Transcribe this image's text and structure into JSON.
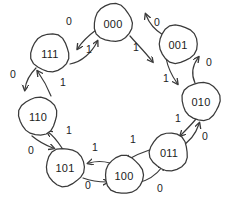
{
  "figure": {
    "title": "",
    "kind": "state-transition-diagram",
    "background_color": "#ffffff",
    "stroke_color": "#3a3a3a",
    "text_color": "#1c1c1c"
  },
  "chart_data": {
    "type": "diagram",
    "title": "",
    "xlabel": "",
    "ylabel": "",
    "nodes": [
      {
        "id": "000",
        "label": "000",
        "cx": 113,
        "cy": 23,
        "r": 19
      },
      {
        "id": "001",
        "label": "001",
        "cx": 178,
        "cy": 44,
        "r": 19
      },
      {
        "id": "010",
        "label": "010",
        "cx": 201,
        "cy": 101,
        "r": 19
      },
      {
        "id": "011",
        "label": "011",
        "cx": 169,
        "cy": 152,
        "r": 19
      },
      {
        "id": "100",
        "label": "100",
        "cx": 124,
        "cy": 175,
        "r": 19
      },
      {
        "id": "101",
        "label": "101",
        "cx": 65,
        "cy": 167,
        "r": 19
      },
      {
        "id": "110",
        "label": "110",
        "cx": 38,
        "cy": 116,
        "r": 19
      },
      {
        "id": "111",
        "label": "111",
        "cx": 50,
        "cy": 53,
        "r": 19
      }
    ],
    "edges": [
      {
        "from": "000",
        "to": "111",
        "label": "0",
        "lx": 69,
        "ly": 21,
        "d": "M 96 30 C 88 36 82 42 78 48",
        "arrow": [
          78,
          48,
          133
        ]
      },
      {
        "from": "111",
        "to": "000",
        "label": "1",
        "lx": 89,
        "ly": 49,
        "d": "M 70 64 C 82 62 92 52 97 42",
        "arrow": [
          97,
          42,
          -62
        ]
      },
      {
        "from": "001",
        "to": "000",
        "label": "0",
        "lx": 157,
        "ly": 22,
        "d": "M 163 35 C 155 30 149 23 146 15",
        "arrow": [
          146,
          15,
          -112
        ]
      },
      {
        "from": "000",
        "to": "010",
        "label": "1",
        "lx": 136,
        "ly": 47,
        "d": "M 130 36 C 137 44 145 52 152 61",
        "arrow": [
          152,
          61,
          52
        ]
      },
      {
        "from": "010",
        "to": "001",
        "label": "0",
        "lx": 209,
        "ly": 62,
        "d": "M 195 83 C 191 74 192 66 198 58",
        "arrow": [
          198,
          58,
          -50
        ]
      },
      {
        "from": "001",
        "to": "010",
        "label": "1",
        "lx": 166,
        "ly": 78,
        "d": "M 166 58 C 168 68 172 76 177 83",
        "arrow": [
          177,
          83,
          54
        ]
      },
      {
        "from": "010",
        "to": "011",
        "label": "1",
        "lx": 178,
        "ly": 118,
        "d": "M 196 119 C 191 125 186 130 181 135",
        "arrow": [
          181,
          135,
          136
        ]
      },
      {
        "from": "011",
        "to": "010",
        "label": "0",
        "lx": 205,
        "ly": 136,
        "d": "M 180 147 C 190 142 196 133 199 124",
        "arrow": [
          199,
          124,
          -70
        ]
      },
      {
        "from": "011",
        "to": "100",
        "label": "1",
        "lx": 133,
        "ly": 139,
        "d": "M 152 149 C 143 152 134 156 127 160",
        "arrow": [
          127,
          160,
          152
        ]
      },
      {
        "from": "100",
        "to": "011",
        "label": "0",
        "lx": 160,
        "ly": 188,
        "d": "M 137 183 C 148 181 157 174 163 166",
        "arrow": [
          163,
          166,
          -52
        ]
      },
      {
        "from": "100",
        "to": "101",
        "label": "1",
        "lx": 95,
        "ly": 147,
        "d": "M 110 163 C 103 161 96 161 89 163",
        "arrow": [
          89,
          163,
          168
        ]
      },
      {
        "from": "101",
        "to": "100",
        "label": "0",
        "lx": 88,
        "ly": 185,
        "d": "M 83 178 C 91 181 99 182 107 182",
        "arrow": [
          107,
          182,
          2
        ]
      },
      {
        "from": "101",
        "to": "110",
        "label": "1",
        "lx": 69,
        "ly": 130,
        "d": "M 62 148 C 58 142 54 136 48 132",
        "arrow": [
          48,
          132,
          -148
        ]
      },
      {
        "from": "110",
        "to": "101",
        "label": "0",
        "lx": 31,
        "ly": 150,
        "d": "M 32 136 C 38 141 45 145 53 148",
        "arrow": [
          53,
          148,
          22
        ]
      },
      {
        "from": "111",
        "to": "110",
        "label": "0",
        "lx": 13,
        "ly": 74,
        "d": "M 36 68 C 30 74 26 81 25 89",
        "arrow": [
          25,
          89,
          100
        ]
      },
      {
        "from": "110",
        "to": "111",
        "label": "1",
        "lx": 63,
        "ly": 82,
        "d": "M 51 96 C 47 86 43 79 38 72",
        "arrow": [
          38,
          72,
          -126
        ]
      }
    ],
    "legend": []
  }
}
